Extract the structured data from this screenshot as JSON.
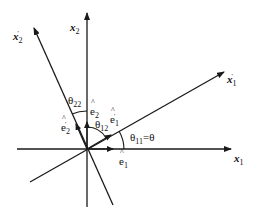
{
  "diagram": {
    "type": "coordinate-rotation",
    "colors": {
      "line": "#1a1a1a",
      "background": "#ffffff"
    },
    "axes": {
      "x1": {
        "base": "x",
        "sub": "1",
        "prime": ""
      },
      "x2": {
        "base": "x",
        "sub": "2",
        "prime": ""
      },
      "x1p": {
        "base": "x",
        "sub": "1",
        "prime": "'"
      },
      "x2p": {
        "base": "x",
        "sub": "2",
        "prime": "'"
      }
    },
    "unit_vectors": {
      "e1": {
        "base": "e",
        "sub": "1",
        "prime": ""
      },
      "e2": {
        "base": "e",
        "sub": "2",
        "prime": ""
      },
      "e1p": {
        "base": "e",
        "sub": "1",
        "prime": "'"
      },
      "e2p": {
        "base": "e",
        "sub": "2",
        "prime": "'"
      }
    },
    "angles": {
      "theta11": {
        "symbol": "θ",
        "sub": "11",
        "suffix": "=θ"
      },
      "theta12": {
        "symbol": "θ",
        "sub": "12",
        "suffix": ""
      },
      "theta22": {
        "symbol": "θ",
        "sub": "22",
        "suffix": ""
      }
    }
  }
}
